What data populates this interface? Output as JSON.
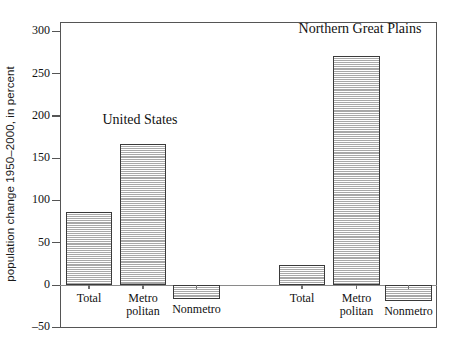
{
  "chart_data": {
    "type": "bar",
    "title": "",
    "subtitle": "",
    "xlabel": "",
    "ylabel": "population change 1950–2000, in percent",
    "ylim": [
      -50,
      300
    ],
    "ytick_labels": [
      "300",
      "250",
      "200",
      "150",
      "100",
      "50",
      "0",
      "–50"
    ],
    "ytick_values": [
      300,
      250,
      200,
      150,
      100,
      50,
      0,
      -50
    ],
    "grid": false,
    "legend": "none",
    "groups": [
      {
        "name": "United States",
        "categories": [
          "Total",
          "Metro politan",
          "Nonmetro"
        ],
        "values": [
          86,
          167,
          -17
        ]
      },
      {
        "name": "Northern Great Plains",
        "categories": [
          "Total",
          "Metro politan",
          "Nonmetro"
        ],
        "values": [
          24,
          271,
          -19
        ]
      }
    ],
    "categories": [
      "Total",
      "Metro politan",
      "Nonmetro",
      "Total",
      "Metro politan",
      "Nonmetro"
    ],
    "values": [
      86,
      167,
      -17,
      24,
      271,
      -19
    ],
    "annotations": [
      "United States",
      "Northern Great Plains"
    ]
  },
  "axis": {
    "y_title": "population change 1950–2000, in percent",
    "ticks": [
      {
        "label": "300",
        "value": 300
      },
      {
        "label": "250",
        "value": 250
      },
      {
        "label": "200",
        "value": 200
      },
      {
        "label": "150",
        "value": 150
      },
      {
        "label": "100",
        "value": 100
      },
      {
        "label": "50",
        "value": 50
      },
      {
        "label": "0",
        "value": 0
      },
      {
        "label": "–50",
        "value": -50
      }
    ]
  },
  "groups": {
    "us": {
      "title": "United States",
      "bars": [
        {
          "label_line1": "Total",
          "label_line2": "",
          "value": 86
        },
        {
          "label_line1": "Metro",
          "label_line2": "politan",
          "value": 167
        },
        {
          "label_line1": "Nonmetro",
          "label_line2": "",
          "value": -17
        }
      ]
    },
    "ngp": {
      "title": "Northern Great Plains",
      "bars": [
        {
          "label_line1": "Total",
          "label_line2": "",
          "value": 24
        },
        {
          "label_line1": "Metro",
          "label_line2": "politan",
          "value": 271
        },
        {
          "label_line1": "Nonmetro",
          "label_line2": "",
          "value": -19
        }
      ]
    }
  },
  "colors": {
    "bar_fill": "#c9c9c9",
    "bar_hatch": "#a8a8a8",
    "bar_border": "#3a3a3a",
    "axis": "#555555",
    "text": "#111111",
    "background": "#ffffff"
  }
}
